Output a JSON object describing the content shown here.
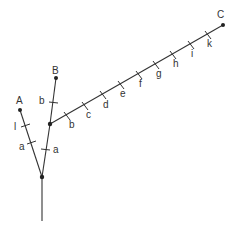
{
  "diagram": {
    "type": "phylogenetic-tree",
    "colors": {
      "line": "#333333",
      "node": "#222222",
      "background": "#ffffff"
    },
    "nodes": {
      "root_stem_end": {
        "x": 42,
        "y": 221
      },
      "root": {
        "x": 42,
        "y": 177
      },
      "A": {
        "x": 20,
        "y": 110,
        "label": "A"
      },
      "junction": {
        "x": 50,
        "y": 124
      },
      "B": {
        "x": 56,
        "y": 78,
        "label": "B"
      },
      "C": {
        "x": 223,
        "y": 25,
        "label": "C"
      }
    },
    "branches": [
      {
        "from": "root",
        "to": "A",
        "marks": [
          "a",
          "l"
        ]
      },
      {
        "from": "root",
        "to": "junction",
        "marks": [
          "a"
        ]
      },
      {
        "from": "junction",
        "to": "B",
        "marks": [
          "b"
        ]
      },
      {
        "from": "junction",
        "to": "C",
        "marks": [
          "b",
          "c",
          "d",
          "e",
          "f",
          "g",
          "h",
          "i",
          "k"
        ]
      }
    ],
    "labels": {
      "A": "A",
      "B": "B",
      "C": "C",
      "mark_a_left": "a",
      "mark_l": "l",
      "mark_a_right": "a",
      "mark_b_B": "b",
      "mark_b": "b",
      "mark_c": "c",
      "mark_d": "d",
      "mark_e": "e",
      "mark_f": "f",
      "mark_g": "g",
      "mark_h": "h",
      "mark_i": "i",
      "mark_k": "k"
    }
  }
}
